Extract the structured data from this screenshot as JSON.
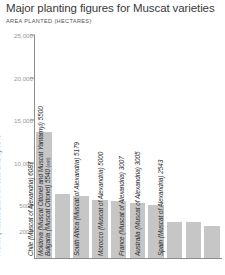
{
  "header": {
    "title": "Major planting figures for Muscat varieties",
    "subtitle": "AREA PLANTED (HECTARES)"
  },
  "chart_data": {
    "type": "bar",
    "title": "Major planting figures for Muscat varieties",
    "subtitle": "AREA PLANTED (HECTARES)",
    "xlabel": "",
    "ylabel": "AREA PLANTED (HECTARES)",
    "ylim": [
      0,
      25000
    ],
    "grid": false,
    "legend": "none",
    "orientation": "vertical",
    "bar_color": "#c6c6c6",
    "axis_color": "#8c8c8c",
    "tick_label_color": "#9a9a9a",
    "ticks": [
      {
        "value": 25000,
        "label": "25,000"
      },
      {
        "value": 20000,
        "label": "20,000"
      },
      {
        "value": 15000,
        "label": "15,000"
      },
      {
        "value": 10000,
        "label": "10,000"
      },
      {
        "value": 5000,
        "label": "5000"
      },
      {
        "value": 2000,
        "label": "2000"
      }
    ],
    "categories": [
      "Italy (Muscat Blanc à Petits Grains)",
      "France (Muscat Blanc à Petits Grains)",
      "Chile (Muscat of Alexandria)",
      "Bulgaria (Muscat Ottonel)",
      "Moldova (Muscat Ottonel and Muscat Yantarnyi)",
      "South Africa (Muscat of Alexandria)",
      "Morocco (Muscat of Alexandria)",
      "France (Muscat of Alexandria)",
      "Australia (Muscat of Alexandria)",
      "Spain (Muscat of Alexandria)"
    ],
    "values": [
      13533,
      6349,
      6087,
      5540,
      5500,
      5179,
      5000,
      3007,
      3005,
      2543
    ],
    "bars": [
      {
        "label": "Italy (Muscat Blanc à Petits Grains) 13,533",
        "country": "Italy",
        "variety": "Muscat Blanc à Petits Grains",
        "value": 13533,
        "value_text": "13,533",
        "note": ""
      },
      {
        "label": "France (Muscat Blanc à Petits Grains) 6349",
        "country": "France",
        "variety": "Muscat Blanc à Petits Grains",
        "value": 6349,
        "value_text": "6349",
        "note": ""
      },
      {
        "label": "Chile (Muscat of Alexandria) 6087",
        "country": "Chile",
        "variety": "Muscat of Alexandria",
        "value": 6087,
        "value_text": "6087",
        "note": ""
      },
      {
        "label": "Bulgaria (Muscat Ottonel) 5540",
        "country": "Bulgaria",
        "variety": "Muscat Ottonel",
        "value": 5540,
        "value_text": "5540",
        "note": "(est)"
      },
      {
        "label": "Moldova (Muscat Ottonel and Muscat Yantarnyi) 5500",
        "country": "Moldova",
        "variety": "Muscat Ottonel and Muscat Yantarnyi",
        "value": 5500,
        "value_text": "5500",
        "note": ""
      },
      {
        "label": "South Africa (Muscat of Alexandria) 5179",
        "country": "South Africa",
        "variety": "Muscat of Alexandria",
        "value": 5179,
        "value_text": "5179",
        "note": ""
      },
      {
        "label": "Morocco (Muscat of Alexandria) 5000",
        "country": "Morocco",
        "variety": "Muscat of Alexandria",
        "value": 5000,
        "value_text": "5000",
        "note": ""
      },
      {
        "label": "France (Muscat of Alexandria) 3007",
        "country": "France",
        "variety": "Muscat of Alexandria",
        "value": 3007,
        "value_text": "3007",
        "note": ""
      },
      {
        "label": "Australia (Muscat of Alexandria) 3005",
        "country": "Australia",
        "variety": "Muscat of Alexandria",
        "value": 3005,
        "value_text": "3005",
        "note": ""
      },
      {
        "label": "Spain (Muscat of Alexandria) 2543",
        "country": "Spain",
        "variety": "Muscat of Alexandria",
        "value": 2543,
        "value_text": "2543",
        "note": ""
      }
    ]
  }
}
